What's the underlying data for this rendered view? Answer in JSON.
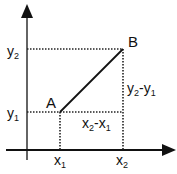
{
  "diagram": {
    "type": "coordinate-geometry",
    "colors": {
      "line": "#111111",
      "background": "#ffffff"
    },
    "axes": {
      "x_axis": {
        "label": ""
      },
      "y_axis": {
        "label": ""
      }
    },
    "points": [
      {
        "name": "A",
        "label": "A",
        "coords": [
          "x1",
          "y1"
        ]
      },
      {
        "name": "B",
        "label": "B",
        "coords": [
          "x2",
          "y2"
        ]
      }
    ],
    "labels": {
      "point_a": "A",
      "point_b": "B",
      "x1": {
        "base": "x",
        "sub": "1"
      },
      "x2": {
        "base": "x",
        "sub": "2"
      },
      "y1": {
        "base": "y",
        "sub": "1"
      },
      "y2": {
        "base": "y",
        "sub": "2"
      },
      "dx": {
        "a": "x",
        "a_sub": "2",
        "op": "-",
        "b": "x",
        "b_sub": "1"
      },
      "dy": {
        "a": "y",
        "a_sub": "2",
        "op": "-",
        "b": "y",
        "b_sub": "1"
      }
    }
  }
}
